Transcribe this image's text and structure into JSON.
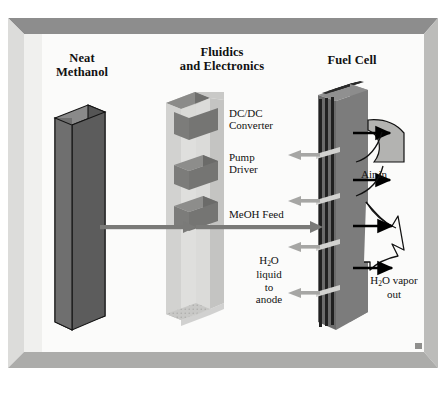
{
  "figure": {
    "kind": "direct-methanol-fuel-cell-system-schematic",
    "background_color": "#ffffff",
    "frame": {
      "face_color": "#f2f2f0",
      "bevel_top_color": "#8d8d8d",
      "bevel_left_color": "#d8d8d6",
      "bevel_right_color": "#b8b8b6",
      "bevel_bottom_color": "#a9a9a7",
      "inner_color": "#fbfbfa"
    }
  },
  "titles": {
    "neat_methanol": "Neat\nMethanol",
    "neat_methanol_line1": "Neat",
    "neat_methanol_line2": "Methanol",
    "fluidics": "Fluidics\nand Electronics",
    "fluidics_line1": "Fluidics",
    "fluidics_line2": "and Electronics",
    "fuel_cell": "Fuel Cell"
  },
  "labels": {
    "dcdc_converter_line1": "DC/DC",
    "dcdc_converter_line2": "Converter",
    "pump_driver_line1": "Pump",
    "pump_driver_line2": "Driver",
    "meoh_feed": "MeOH Feed",
    "h2o_liquid_line2": "liquid",
    "h2o_liquid_line3": "to",
    "h2o_liquid_line4": "anode",
    "air_in": "Air in",
    "h2o_vapor_line2": "vapor",
    "h2o_vapor_line3": "out"
  },
  "chemical_formulas": {
    "water_prefix": "H",
    "water_subscript": "2",
    "water_suffix": "O"
  },
  "components": {
    "methanol_cartridge": {
      "name": "Neat Methanol cartridge",
      "front_face_color": "#6e6e6e",
      "side_face_color": "#565656",
      "top_face_color": "#8a8a8a",
      "outline_color": "#1a1a1a"
    },
    "fluidics_housing": {
      "name": "Fluidics and Electronics housing",
      "front_face_color": "#d9d9d7",
      "side_face_color": "#bdbdbb",
      "top_face_color": "#c9c9c7",
      "floor_color": "#c0c0be"
    },
    "fluidics_modules": [
      {
        "name": "DC/DC Converter slab",
        "color": "#7a7a7a"
      },
      {
        "name": "Pump Driver slab",
        "color": "#7a7a7a"
      },
      {
        "name": "MeOH pump slab",
        "color": "#7a7a7a"
      }
    ],
    "fuel_cell_stack": {
      "name": "Fuel Cell stack",
      "plate_color": "#6a6a6a",
      "dark_plate_color": "#242424",
      "side_face_color": "#8e8e8e",
      "connector_color": "#d0d0ce",
      "plate_count": 4
    },
    "air_flow_wedge": {
      "name": "Air in flow region",
      "color": "#b4b4b2"
    },
    "vapor_flow_funnel": {
      "name": "H2O vapor out flow region",
      "color": "#fbfbfa"
    }
  },
  "arrows": {
    "meoh_feed_arrow": {
      "direction": "right",
      "color": "#7a7a7a"
    },
    "electrical_arrows": [
      {
        "name": "dcdc-return-arrow",
        "direction": "left",
        "color": "#a6a6a4"
      },
      {
        "name": "pump-driver-return-arrow",
        "direction": "left",
        "color": "#a6a6a4"
      },
      {
        "name": "mid-return-arrow",
        "direction": "left",
        "color": "#a6a6a4"
      },
      {
        "name": "h2o-liquid-arrow",
        "direction": "left",
        "color": "#a6a6a4"
      }
    ],
    "air_arrows": [
      {
        "name": "air-in-upper-arrow",
        "direction": "right",
        "color": "#000000"
      },
      {
        "name": "air-in-lower-arrow",
        "direction": "right",
        "color": "#000000"
      }
    ],
    "vapor_arrows": [
      {
        "name": "vapor-out-upper-arrow",
        "direction": "right",
        "color": "#000000"
      },
      {
        "name": "vapor-out-lower-arrow",
        "direction": "right",
        "color": "#000000"
      }
    ]
  }
}
